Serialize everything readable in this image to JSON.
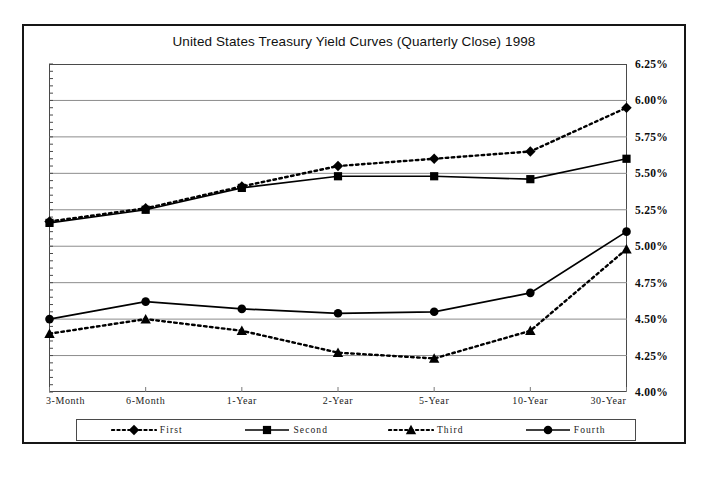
{
  "chart_data": {
    "type": "line",
    "title": "United States Treasury Yield Curves (Quarterly Close) 1998",
    "xlabel": "",
    "ylabel": "",
    "categories": [
      "3-Month",
      "6-Month",
      "1-Year",
      "2-Year",
      "5-Year",
      "10-Year",
      "30-Year"
    ],
    "ylim": [
      4.0,
      6.25
    ],
    "ytick_labels": [
      "6.25%",
      "6.00%",
      "5.75%",
      "5.50%",
      "5.25%",
      "5.00%",
      "4.75%",
      "4.50%",
      "4.25%",
      "4.00%"
    ],
    "ytick_values": [
      6.25,
      6.0,
      5.75,
      5.5,
      5.25,
      5.0,
      4.75,
      4.5,
      4.25,
      4.0
    ],
    "ytick_step": 0.25,
    "grid": true,
    "legend_position": "bottom",
    "series": [
      {
        "name": "First",
        "marker": "diamond",
        "line_style": "dotted",
        "color": "#000000",
        "values": [
          5.17,
          5.26,
          5.41,
          5.55,
          5.6,
          5.65,
          5.95
        ]
      },
      {
        "name": "Second",
        "marker": "square",
        "line_style": "solid",
        "color": "#000000",
        "values": [
          5.16,
          5.25,
          5.4,
          5.48,
          5.48,
          5.46,
          5.6
        ]
      },
      {
        "name": "Third",
        "marker": "triangle",
        "line_style": "dotted",
        "color": "#000000",
        "values": [
          4.4,
          4.5,
          4.42,
          4.27,
          4.23,
          4.42,
          4.98
        ]
      },
      {
        "name": "Fourth",
        "marker": "circle",
        "line_style": "solid",
        "color": "#000000",
        "values": [
          4.5,
          4.62,
          4.57,
          4.54,
          4.55,
          4.68,
          5.1
        ]
      }
    ]
  }
}
